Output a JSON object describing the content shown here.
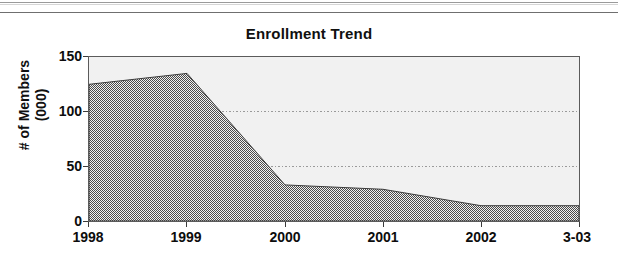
{
  "page": {
    "width": 618,
    "height": 262,
    "background": "#ffffff"
  },
  "rules": {
    "top_rule_label": "page-rule-top",
    "second_rule_label": "page-rule-second"
  },
  "chart_data": {
    "type": "area",
    "title": "Enrollment Trend",
    "xlabel": "",
    "ylabel": "# of Members\n(000)",
    "ylabel_line1": "# of Members",
    "ylabel_line2": "(000)",
    "categories": [
      "1998",
      "1999",
      "2000",
      "2001",
      "2002",
      "3-03"
    ],
    "values": [
      125,
      135,
      33,
      29,
      14,
      14
    ],
    "ylim": [
      0,
      150
    ],
    "yticks": [
      0,
      50,
      100,
      150
    ],
    "ytick_labels": [
      "0",
      "50",
      "100",
      "150"
    ],
    "gridlines": [
      50,
      100
    ],
    "grid": true,
    "grid_style": "dotted",
    "legend": null,
    "legend_position": "none",
    "series": [
      {
        "name": "Enrollment",
        "values": [
          125,
          135,
          33,
          29,
          14,
          14
        ],
        "fill_color": "#676767",
        "fill_pattern": "checkered-dither"
      }
    ],
    "plot_background": "#f1f1f1",
    "axis_color": "#5b5b5b",
    "text_color": "#101010"
  }
}
